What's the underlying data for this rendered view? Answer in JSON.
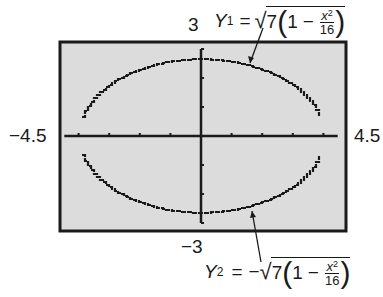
{
  "figure": {
    "window": {
      "xmin": -4.5,
      "xmax": 4.5,
      "ymin": -3,
      "ymax": 3,
      "xscl": 1,
      "yscl": 1
    },
    "labels": {
      "ymax": "3",
      "ymin": "−3",
      "xmin": "−4.5",
      "xmax": "4.5"
    },
    "equations": {
      "y1": {
        "name": "Y",
        "subscript": "1",
        "equals": "=",
        "sign": "",
        "sqrt": "√",
        "coef": "7",
        "open": "(",
        "one": "1",
        "minus": "−",
        "num_var": "x",
        "num_exp": "2",
        "den": "16",
        "close": ")"
      },
      "y2": {
        "name": "Y",
        "subscript": "2",
        "equals": "=",
        "sign": "−",
        "sqrt": "√",
        "coef": "7",
        "open": "(",
        "one": "1",
        "minus": "−",
        "num_var": "x",
        "num_exp": "2",
        "den": "16",
        "close": ")"
      }
    },
    "colors": {
      "screen_bg": "#dcdcdc",
      "ink": "#1a1a1a",
      "page_bg": "#ffffff"
    }
  },
  "chart_data": {
    "type": "line",
    "title": "",
    "xlabel": "",
    "ylabel": "",
    "xlim": [
      -4.5,
      4.5
    ],
    "ylim": [
      -3,
      3
    ],
    "grid": false,
    "x_ticks": [
      -4,
      -3,
      -2,
      -1,
      1,
      2,
      3,
      4
    ],
    "y_ticks": [
      -3,
      -2,
      -1,
      1,
      2,
      3
    ],
    "tick_labels": {
      "left": "−4.5",
      "right": "4.5",
      "top": "3",
      "bottom": "−3"
    },
    "series": [
      {
        "name": "Y1 = √(7(1 − x²/16))",
        "equation": "sqrt(7*(1 - x^2/16))",
        "x": [
          -4,
          -3.5,
          -3,
          -2.5,
          -2,
          -1.5,
          -1,
          -0.5,
          0,
          0.5,
          1,
          1.5,
          2,
          2.5,
          3,
          3.5,
          4
        ],
        "values": [
          0,
          1.28,
          1.75,
          2.07,
          2.29,
          2.45,
          2.56,
          2.62,
          2.65,
          2.62,
          2.56,
          2.45,
          2.29,
          2.07,
          1.75,
          1.28,
          0
        ]
      },
      {
        "name": "Y2 = −√(7(1 − x²/16))",
        "equation": "-sqrt(7*(1 - x^2/16))",
        "x": [
          -4,
          -3.5,
          -3,
          -2.5,
          -2,
          -1.5,
          -1,
          -0.5,
          0,
          0.5,
          1,
          1.5,
          2,
          2.5,
          3,
          3.5,
          4
        ],
        "values": [
          0,
          -1.28,
          -1.75,
          -2.07,
          -2.29,
          -2.45,
          -2.56,
          -2.62,
          -2.65,
          -2.62,
          -2.56,
          -2.45,
          -2.29,
          -2.07,
          -1.75,
          -1.28,
          0
        ]
      }
    ],
    "annotations": [
      {
        "text": "Y1 = √(7(1 − x²/16))",
        "points_to": "upper half of ellipse"
      },
      {
        "text": "Y2 = −√(7(1 − x²/16))",
        "points_to": "lower half of ellipse"
      }
    ]
  }
}
